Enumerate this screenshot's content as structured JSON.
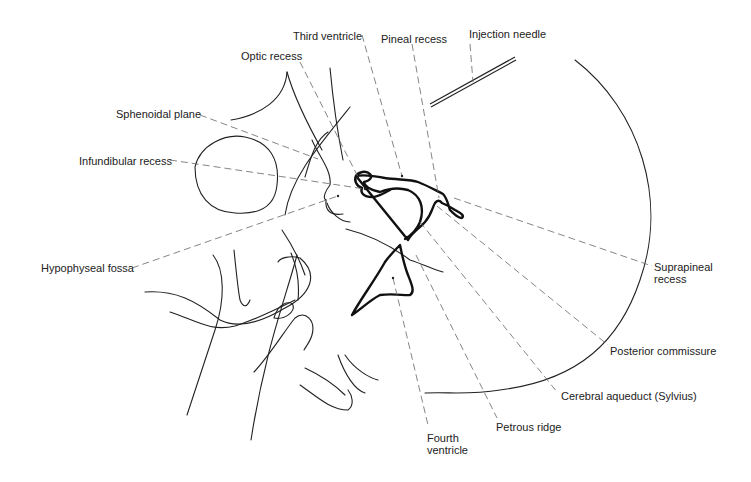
{
  "figure": {
    "colors": {
      "line": "#222222",
      "leader": "#666666",
      "background": "#ffffff"
    }
  },
  "labels": {
    "third_ventricle": "Third ventricle",
    "pineal_recess": "Pineal recess",
    "injection_needle": "Injection needle",
    "optic_recess": "Optic recess",
    "sphenoidal_plane": "Sphenoidal plane",
    "infundibular_recess": "Infundibular recess",
    "hypophyseal_fossa": "Hypophyseal fossa",
    "suprapineal_recess": "Suprapineal\nrecess",
    "posterior_commissure": "Posterior commissure",
    "cerebral_aqueduct": "Cerebral aqueduct (Sylvius)",
    "petrous_ridge": "Petrous ridge",
    "fourth_ventricle": "Fourth\nventricle"
  }
}
